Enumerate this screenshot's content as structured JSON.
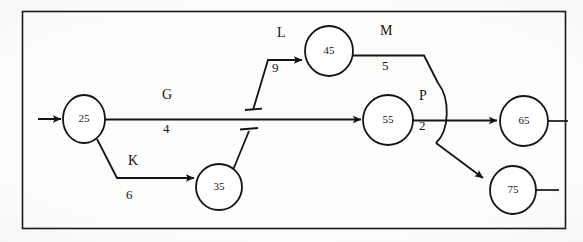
{
  "diagram": {
    "kind": "activity-on-arrow-network",
    "title_visible": false,
    "border": {
      "color": "#1a1a1a",
      "x": 22,
      "y": 11,
      "width": 543,
      "height": 217
    },
    "stroke_color": "#141414",
    "text_color": "#15110f",
    "background": "#fdfdfc",
    "nodes": [
      {
        "id": "n25",
        "label": "25",
        "cx": 84,
        "cy": 119,
        "rx": 21,
        "ry": 24
      },
      {
        "id": "n35",
        "label": "35",
        "cx": 219,
        "cy": 187,
        "rx": 23,
        "ry": 23
      },
      {
        "id": "n45",
        "label": "45",
        "cx": 329,
        "cy": 51,
        "rx": 24,
        "ry": 25
      },
      {
        "id": "n55",
        "label": "55",
        "cx": 388,
        "cy": 120,
        "rx": 25,
        "ry": 25
      },
      {
        "id": "n65",
        "label": "65",
        "cx": 524,
        "cy": 121,
        "rx": 24,
        "ry": 25
      },
      {
        "id": "n75",
        "label": "75",
        "cx": 513,
        "cy": 190,
        "rx": 23,
        "ry": 24
      }
    ],
    "activities": [
      {
        "id": "G",
        "name": "G",
        "duration": "4",
        "from": "25",
        "to": "55",
        "name_x": 162,
        "name_y": 95,
        "dur_x": 163,
        "dur_y": 129
      },
      {
        "id": "K",
        "name": "K",
        "duration": "6",
        "from": "25",
        "to": "35",
        "name_x": 128,
        "name_y": 161,
        "dur_x": 126,
        "dur_y": 195
      },
      {
        "id": "L",
        "name": "L",
        "duration": "9",
        "from": "dummy-junction-G",
        "to": "45",
        "name_x": 277,
        "name_y": 34,
        "dur_x": 272,
        "dur_y": 68
      },
      {
        "id": "M",
        "name": "M",
        "duration": "5",
        "from": "45",
        "to": "75",
        "name_x": 383,
        "name_y": 31,
        "dur_x": 382,
        "dur_y": 65
      },
      {
        "id": "P",
        "name": "P",
        "duration": "2",
        "from": "55",
        "to": "65",
        "name_x": 419,
        "name_y": 96,
        "dur_x": 419,
        "dur_y": 125
      }
    ],
    "start_arrow": {
      "label": "start-arrow-into-25",
      "from_x": 38,
      "to_x": 62,
      "y": 119
    },
    "terminal_stubs": [
      {
        "label": "stub-out-of-65",
        "x1": 548,
        "y1": 121,
        "x2": 568,
        "y2": 121
      },
      {
        "label": "stub-out-of-75",
        "x1": 536,
        "y1": 190,
        "x2": 559,
        "y2": 190
      }
    ],
    "dummy_links": [
      {
        "label": "dummy-from-G-up-to-L",
        "note": "flat-ended tick terminator on G line"
      },
      {
        "label": "dummy-from-35-up-to-G",
        "note": "flat-ended tick terminator below G line"
      }
    ],
    "line_hop": {
      "label": "line-hop-over-P",
      "note": "M->75 bows over the P arrow"
    }
  }
}
